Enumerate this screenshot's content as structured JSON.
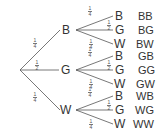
{
  "tree": {
    "level1": [
      {
        "node": "B",
        "prob": {
          "num": "1",
          "den": "4"
        }
      },
      {
        "node": "G",
        "prob": {
          "num": "1",
          "den": "2"
        }
      },
      {
        "node": "W",
        "prob": {
          "num": "1",
          "den": "4"
        }
      }
    ],
    "level2": [
      {
        "parent": "B",
        "branches": [
          {
            "node": "B",
            "prob": {
              "num": "1",
              "den": "4"
            },
            "outcome": "BB"
          },
          {
            "node": "G",
            "prob": {
              "num": "1",
              "den": "2"
            },
            "outcome": "BG"
          },
          {
            "node": "W",
            "prob": {
              "num": "1",
              "den": "4"
            },
            "outcome": "BW"
          }
        ]
      },
      {
        "parent": "G",
        "branches": [
          {
            "node": "B",
            "prob": {
              "num": "1",
              "den": "4"
            },
            "outcome": "GB"
          },
          {
            "node": "G",
            "prob": {
              "num": "1",
              "den": "2"
            },
            "outcome": "GG"
          },
          {
            "node": "W",
            "prob": {
              "num": "1",
              "den": "4"
            },
            "outcome": "GW"
          }
        ]
      },
      {
        "parent": "W",
        "branches": [
          {
            "node": "B",
            "prob": {
              "num": "1",
              "den": "4"
            },
            "outcome": "WB"
          },
          {
            "node": "G",
            "prob": {
              "num": "1",
              "den": "2"
            },
            "outcome": "WG"
          },
          {
            "node": "W",
            "prob": {
              "num": "1",
              "den": "4"
            },
            "outcome": "WW"
          }
        ]
      }
    ]
  },
  "colors": {
    "line": "#555555",
    "text": "#333333"
  }
}
